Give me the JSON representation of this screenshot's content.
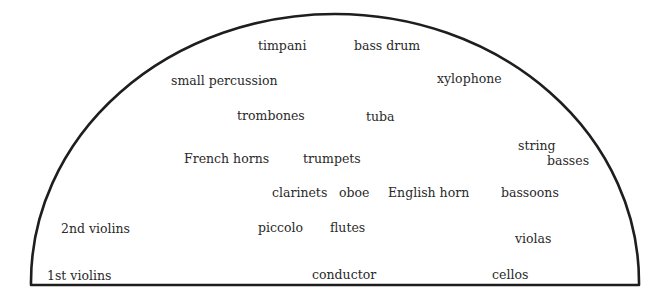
{
  "diagram": {
    "stroke_color": "#1e1e1e",
    "text_color": "#2a2a2a",
    "sections": [
      {
        "id": "timpani",
        "label": "timpani"
      },
      {
        "id": "bass-drum",
        "label": "bass drum"
      },
      {
        "id": "small-percussion",
        "label": "small percussion"
      },
      {
        "id": "xylophone",
        "label": "xylophone"
      },
      {
        "id": "trombones",
        "label": "trombones"
      },
      {
        "id": "tuba",
        "label": "tuba"
      },
      {
        "id": "string-basses-1",
        "label": "string"
      },
      {
        "id": "string-basses-2",
        "label": "basses"
      },
      {
        "id": "french-horns",
        "label": "French horns"
      },
      {
        "id": "trumpets",
        "label": "trumpets"
      },
      {
        "id": "clarinets",
        "label": "clarinets"
      },
      {
        "id": "oboe",
        "label": "oboe"
      },
      {
        "id": "english-horn",
        "label": "English horn"
      },
      {
        "id": "bassoons",
        "label": "bassoons"
      },
      {
        "id": "2nd-violins",
        "label": "2nd violins"
      },
      {
        "id": "piccolo",
        "label": "piccolo"
      },
      {
        "id": "flutes",
        "label": "flutes"
      },
      {
        "id": "violas",
        "label": "violas"
      },
      {
        "id": "1st-violins",
        "label": "1st violins"
      },
      {
        "id": "conductor",
        "label": "conductor"
      },
      {
        "id": "cellos",
        "label": "cellos"
      }
    ]
  }
}
